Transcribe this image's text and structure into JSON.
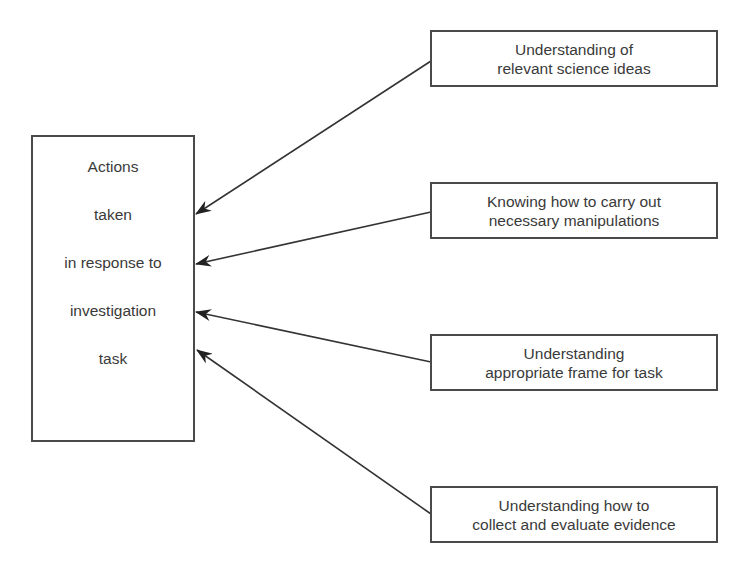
{
  "diagram": {
    "type": "influence-diagram",
    "central_node": {
      "lines": [
        "Actions",
        "taken",
        "in response to",
        "investigation",
        "task"
      ]
    },
    "factors": [
      {
        "id": "science-ideas",
        "lines": [
          "Understanding of",
          "relevant science ideas"
        ]
      },
      {
        "id": "manipulations",
        "lines": [
          "Knowing how to carry out",
          "necessary manipulations"
        ]
      },
      {
        "id": "frame",
        "lines": [
          "Understanding",
          "appropriate frame for task"
        ]
      },
      {
        "id": "evidence",
        "lines": [
          "Understanding how to",
          "collect and evaluate evidence"
        ]
      }
    ],
    "edges": [
      {
        "from": "science-ideas",
        "to": "central_node"
      },
      {
        "from": "manipulations",
        "to": "central_node"
      },
      {
        "from": "frame",
        "to": "central_node"
      },
      {
        "from": "evidence",
        "to": "central_node"
      }
    ],
    "colors": {
      "stroke": "#4a4a4a",
      "arrow": "#222222",
      "text": "#3a3a3a",
      "background": "#ffffff"
    }
  }
}
